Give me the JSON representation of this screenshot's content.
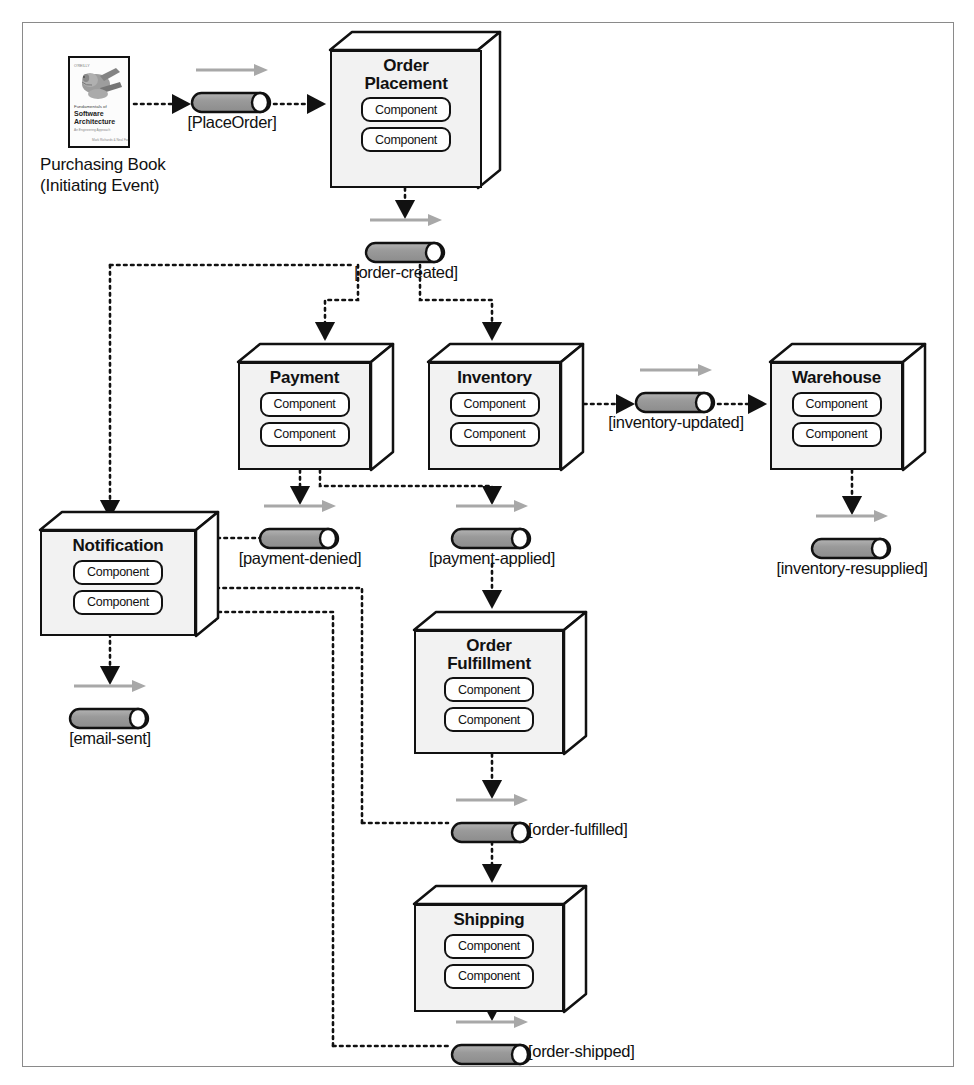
{
  "diagram": {
    "frame_color": "#8a8a8a",
    "box_fill": "#f2f2f2",
    "event_fill": "#9a9a9a",
    "line_color": "#111111",
    "arrow_gray": "#9f9f9f"
  },
  "source": {
    "name": "purchasing-book",
    "caption_line1": "Purchasing Book",
    "caption_line2": "(Initiating Event)",
    "cover": {
      "line1": "Fundamentals of",
      "line2": "Software",
      "line3": "Architecture",
      "line4": "An Engineering Approach",
      "line5": "Mark Richards & Neal Ford",
      "publisher": "O'REILLY"
    }
  },
  "component_label": "Component",
  "services": [
    {
      "id": "order-placement",
      "title_line1": "Order",
      "title_line2": "Placement",
      "components": [
        "Component",
        "Component"
      ]
    },
    {
      "id": "payment",
      "title_line1": "Payment",
      "title_line2": "",
      "components": [
        "Component",
        "Component"
      ]
    },
    {
      "id": "inventory",
      "title_line1": "Inventory",
      "title_line2": "",
      "components": [
        "Component",
        "Component"
      ]
    },
    {
      "id": "warehouse",
      "title_line1": "Warehouse",
      "title_line2": "",
      "components": [
        "Component",
        "Component"
      ]
    },
    {
      "id": "notification",
      "title_line1": "Notification",
      "title_line2": "",
      "components": [
        "Component",
        "Component"
      ]
    },
    {
      "id": "order-fulfillment",
      "title_line1": "Order",
      "title_line2": "Fulfillment",
      "components": [
        "Component",
        "Component"
      ]
    },
    {
      "id": "shipping",
      "title_line1": "Shipping",
      "title_line2": "",
      "components": [
        "Component",
        "Component"
      ]
    }
  ],
  "events": [
    {
      "id": "place-order",
      "label": "[PlaceOrder]"
    },
    {
      "id": "order-created",
      "label": "[order-created]"
    },
    {
      "id": "inventory-updated",
      "label": "[inventory-updated]"
    },
    {
      "id": "payment-denied",
      "label": "[payment-denied]"
    },
    {
      "id": "payment-applied",
      "label": "[payment-applied]"
    },
    {
      "id": "inventory-resupplied",
      "label": "[inventory-resupplied]"
    },
    {
      "id": "email-sent",
      "label": "[email-sent]"
    },
    {
      "id": "order-fulfilled",
      "label": "[order-fulfilled]"
    },
    {
      "id": "order-shipped",
      "label": "[order-shipped]"
    }
  ],
  "flows": [
    {
      "from": "purchasing-book",
      "to": "place-order"
    },
    {
      "from": "place-order",
      "to": "order-placement"
    },
    {
      "from": "order-placement",
      "to": "order-created"
    },
    {
      "from": "order-created",
      "to": "payment"
    },
    {
      "from": "order-created",
      "to": "inventory"
    },
    {
      "from": "order-created",
      "to": "notification"
    },
    {
      "from": "inventory",
      "to": "inventory-updated"
    },
    {
      "from": "inventory-updated",
      "to": "warehouse"
    },
    {
      "from": "warehouse",
      "to": "inventory-resupplied"
    },
    {
      "from": "payment",
      "to": "payment-denied"
    },
    {
      "from": "payment",
      "to": "payment-applied"
    },
    {
      "from": "payment-denied",
      "to": "notification"
    },
    {
      "from": "payment-applied",
      "to": "order-fulfillment"
    },
    {
      "from": "notification",
      "to": "email-sent"
    },
    {
      "from": "order-fulfillment",
      "to": "order-fulfilled"
    },
    {
      "from": "order-fulfilled",
      "to": "shipping"
    },
    {
      "from": "order-fulfilled",
      "to": "notification"
    },
    {
      "from": "shipping",
      "to": "order-shipped"
    },
    {
      "from": "order-shipped",
      "to": "notification"
    }
  ]
}
